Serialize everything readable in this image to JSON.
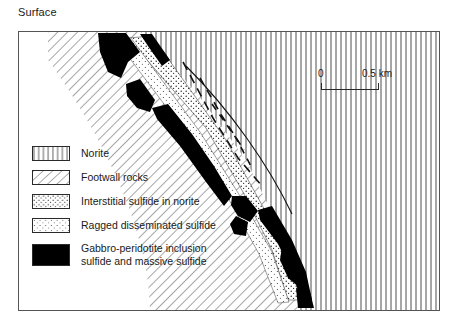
{
  "figure": {
    "surface_label": "Surface",
    "frame": {
      "x": 18,
      "y": 31,
      "width": 422,
      "height": 280
    }
  },
  "scalebar": {
    "min_label": "0",
    "max_label": "0.5 km"
  },
  "legend": {
    "items": [
      {
        "pattern": "vertical-lines",
        "label": "Norite"
      },
      {
        "pattern": "diagonal-lines",
        "label": "Footwall rocks"
      },
      {
        "pattern": "dense-stipple",
        "label": "Interstitial sulfide in norite"
      },
      {
        "pattern": "sparse-stipple",
        "label": "Ragged disseminated sulfide"
      },
      {
        "pattern": "solid-black",
        "label": "Gabbro-peridotite inclusion\nsulfide and massive sulfide"
      }
    ]
  },
  "geology": {
    "units": [
      {
        "name": "norite",
        "pattern": "vertical-lines",
        "position": "upper-right"
      },
      {
        "name": "footwall-rocks",
        "pattern": "diagonal-lines",
        "position": "lower-left"
      },
      {
        "name": "contact-zone",
        "pattern": "stipple-and-black",
        "orientation": "northwest-southeast-dipping"
      }
    ],
    "structures": [
      {
        "name": "fault-trace",
        "style": "dashed"
      },
      {
        "name": "fault-trace",
        "style": "dashed"
      },
      {
        "name": "fault-trace",
        "style": "dashed"
      }
    ]
  },
  "colors": {
    "ink": "#1a1a1a",
    "hatch": "#3a3a3a",
    "black_ore": "#000000",
    "background": "#ffffff"
  }
}
